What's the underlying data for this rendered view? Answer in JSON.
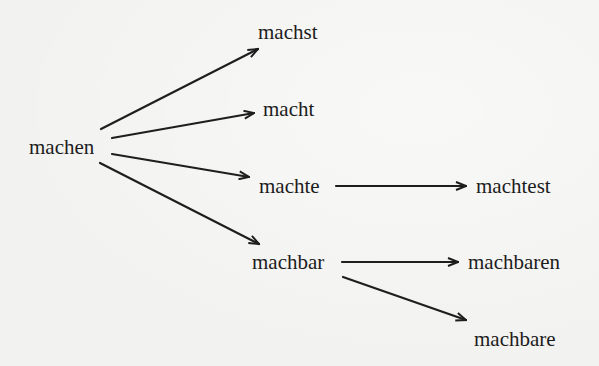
{
  "diagram": {
    "type": "derivation-tree",
    "nodes": {
      "root": "machen",
      "n1": "machst",
      "n2": "macht",
      "n3": "machte",
      "n4": "machtest",
      "n5": "machbar",
      "n6": "machbaren",
      "n7": "machbare"
    },
    "edges": [
      {
        "from": "machen",
        "to": "machst"
      },
      {
        "from": "machen",
        "to": "macht"
      },
      {
        "from": "machen",
        "to": "machte"
      },
      {
        "from": "machen",
        "to": "machbar"
      },
      {
        "from": "machte",
        "to": "machtest"
      },
      {
        "from": "machbar",
        "to": "machbaren"
      },
      {
        "from": "machbar",
        "to": "machbare"
      }
    ],
    "colors": {
      "background": "#f2f2f0",
      "text": "#1c1c1c",
      "arrow": "#1e1e1e"
    }
  }
}
